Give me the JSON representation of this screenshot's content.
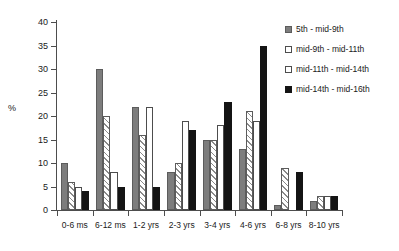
{
  "chart_data": {
    "type": "bar",
    "title": "",
    "xlabel": "",
    "ylabel": "%",
    "ylim": [
      0,
      40
    ],
    "ytick_step": 5,
    "yticks": [
      0,
      5,
      10,
      15,
      20,
      25,
      30,
      35,
      40
    ],
    "grid": false,
    "legend_position": "top-right",
    "categories": [
      "0-6 ms",
      "6-12 ms",
      "1-2 yrs",
      "2-3 yrs",
      "3-4 yrs",
      "4-6 yrs",
      "6-8 yrs",
      "8-10 yrs"
    ],
    "series": [
      {
        "name": "5th - mid-9th",
        "fill": "solid-gray",
        "color": "#7d7d7d",
        "values": [
          10,
          30,
          22,
          8,
          15,
          13,
          1,
          2
        ]
      },
      {
        "name": "mid-9th - mid-11th",
        "fill": "diagonal-hatch",
        "color": "#8a8a8a",
        "values": [
          6,
          20,
          16,
          10,
          15,
          21,
          9,
          3
        ]
      },
      {
        "name": "mid-11th - mid-14th",
        "fill": "white-outline",
        "color": "#ffffff",
        "values": [
          5,
          8,
          22,
          19,
          18,
          19,
          0,
          3
        ]
      },
      {
        "name": "mid-14th - mid-16th",
        "fill": "solid-black",
        "color": "#141414",
        "values": [
          4,
          5,
          5,
          17,
          23,
          35,
          8,
          3
        ]
      }
    ]
  }
}
